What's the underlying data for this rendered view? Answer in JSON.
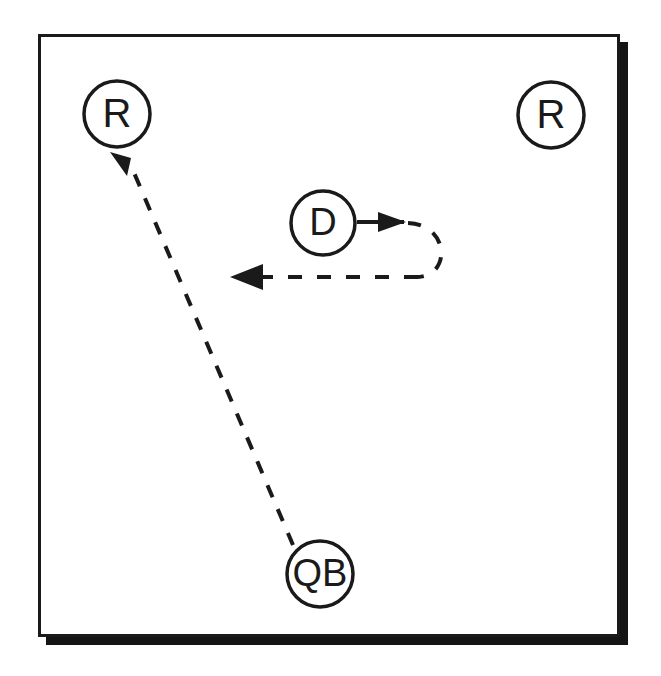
{
  "diagram": {
    "canvas": {
      "width": 661,
      "height": 676
    },
    "colors": {
      "ink": "#1a1a1a",
      "background": "#ffffff",
      "shadow": "#141414",
      "field_fill": "#ffffff"
    },
    "field": {
      "name": "play-field-frame",
      "x": 38,
      "y": 34,
      "width": 582,
      "height": 603,
      "border_width": 3,
      "shadow_offset": 8
    },
    "players": [
      {
        "id": "receiver-left",
        "label": "R",
        "role": "receiver",
        "cx": 117,
        "cy": 114,
        "r": 33,
        "font_size": 40
      },
      {
        "id": "receiver-right",
        "label": "R",
        "role": "receiver",
        "cx": 551,
        "cy": 115,
        "r": 33,
        "font_size": 40
      },
      {
        "id": "defender",
        "label": "D",
        "role": "defender",
        "cx": 323,
        "cy": 223,
        "r": 32,
        "font_size": 38
      },
      {
        "id": "quarterback",
        "label": "QB",
        "role": "quarterback",
        "cx": 320,
        "cy": 574,
        "r": 33,
        "font_size": 38
      }
    ],
    "routes": [
      {
        "id": "pass-route-qb-to-receiver-left",
        "style": "dashed",
        "arrow": "end",
        "from": "quarterback",
        "to": "receiver-left",
        "path": "M 293 545 L 132 168",
        "dash": "13 13",
        "stroke_width": 4
      },
      {
        "id": "defender-drop-route",
        "style": "dashed",
        "arrow": "end",
        "from": "defender",
        "to": "left-flat",
        "path": "M 357 222 L 406 222 M 406 222 C 435 222 441 245 440 256 C 439 269 428 277 415 277 L 240 277",
        "dash": "13 13",
        "stroke_width": 4
      }
    ],
    "arrowheads": [
      {
        "id": "arrowhead-to-receiver-left",
        "points": "132,168 112,151 134,147",
        "direction": "up-left"
      },
      {
        "id": "arrowhead-defender-start",
        "points": "406,222 381,213 381,231",
        "direction": "right"
      },
      {
        "id": "arrowhead-left-flat",
        "points": "230,277 262,265 262,289",
        "direction": "left"
      }
    ]
  }
}
